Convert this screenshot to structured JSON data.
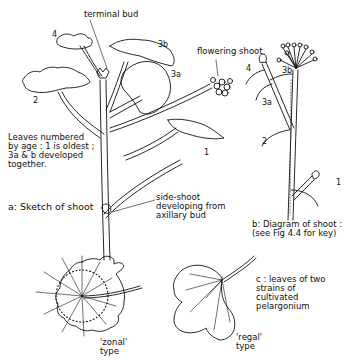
{
  "figure": {
    "part_a": {
      "caption": "a: Sketch of shoot",
      "labels": {
        "terminal_bud": "terminal bud",
        "flowering_shoot": "flowering shoot",
        "side_shoot": "side-shoot\ndeveloping from\naxillary bud",
        "note": "Leaves numbered\nby age : 1 is oldest ;\n3a & b developed\ntogether."
      },
      "leaf_numbers": [
        "4",
        "3b",
        "3a",
        "2",
        "1"
      ]
    },
    "part_b": {
      "caption": "b: Diagram of shoot :\n(see Fig 4.4 for key)",
      "leaf_numbers": [
        "4",
        "3b",
        "3a",
        "2",
        "1"
      ]
    },
    "part_c": {
      "caption": "c : leaves of two\nstrains of\ncultivated\npelargonium",
      "leaf_types": [
        "'zonal'\ntype",
        "'regal'\ntype"
      ]
    },
    "colors": {
      "ink": "#111111",
      "paper": "#ffffff"
    }
  }
}
